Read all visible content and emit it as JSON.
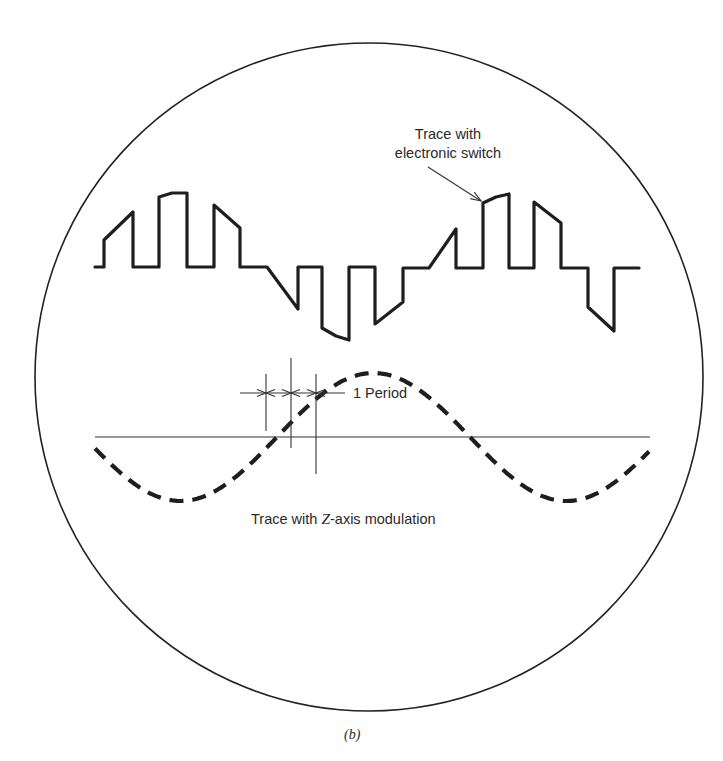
{
  "figure": {
    "caption": "(b)",
    "screen": {
      "shape": "circle",
      "cx": 369,
      "cy": 377,
      "r": 334,
      "stroke": "#222222"
    }
  },
  "labels": {
    "switch_trace_line1": "Trace with",
    "switch_trace_line2": "electronic switch",
    "period": "1 Period",
    "zaxis_prefix": "Trace with ",
    "zaxis_italic": "Z",
    "zaxis_suffix": "-axis modulation"
  },
  "switched_trace": {
    "description": "Chopped sine wave (electronic switch) alternating between baseline and sinusoid segments",
    "baseline_y": 267,
    "stroke_width": 3.2,
    "points": [
      [
        95,
        267
      ],
      [
        104,
        267
      ],
      [
        104,
        240
      ],
      [
        133,
        212
      ],
      [
        133,
        267
      ],
      [
        159,
        267
      ],
      [
        159,
        197
      ],
      [
        172,
        193
      ],
      [
        187,
        193
      ],
      [
        187,
        267
      ],
      [
        214,
        267
      ],
      [
        214,
        205
      ],
      [
        240,
        228
      ],
      [
        240,
        267
      ],
      [
        267,
        267
      ],
      [
        298,
        309
      ],
      [
        298,
        267
      ],
      [
        322,
        267
      ],
      [
        322,
        328
      ],
      [
        336,
        336
      ],
      [
        349,
        340
      ],
      [
        349,
        267
      ],
      [
        375,
        267
      ],
      [
        375,
        324
      ],
      [
        403,
        302
      ],
      [
        403,
        268
      ],
      [
        429,
        268
      ],
      [
        456,
        229
      ],
      [
        456,
        268
      ],
      [
        483,
        268
      ],
      [
        483,
        203
      ],
      [
        496,
        197
      ],
      [
        509,
        194
      ],
      [
        509,
        268
      ],
      [
        534,
        268
      ],
      [
        534,
        202
      ],
      [
        561,
        223
      ],
      [
        561,
        268
      ],
      [
        588,
        268
      ],
      [
        588,
        307
      ],
      [
        614,
        331
      ],
      [
        614,
        268
      ],
      [
        639,
        268
      ]
    ]
  },
  "arrow_pointer": {
    "from": [
      428,
      167
    ],
    "to": [
      481,
      201
    ]
  },
  "zaxis_trace": {
    "description": "Dashed sine wave (Z-axis intensity modulation)",
    "zero_line": {
      "x1": 95,
      "x2": 650,
      "y": 437
    },
    "amplitude": 64,
    "center_y": 437,
    "period_px": 386,
    "x_start": 95,
    "x_end": 650,
    "phase_zero_down_x": 277,
    "dash": "14 9",
    "stroke_width": 4.2
  },
  "period_markers": {
    "arrow_y": 393,
    "arrow_x1": 240,
    "arrow_x2": 345,
    "lines": [
      {
        "x": 266,
        "y1": 374,
        "y2": 431
      },
      {
        "x": 291,
        "y1": 358,
        "y2": 448
      },
      {
        "x": 316,
        "y1": 374,
        "y2": 474
      }
    ]
  }
}
